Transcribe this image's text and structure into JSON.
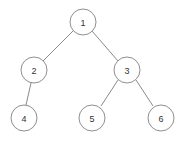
{
  "diagram": {
    "kind": "binary-tree",
    "background_color": "#ffffff",
    "node_fill_color": "#ffffff",
    "node_stroke_color": "#8f8f8f",
    "edge_color": "#8a8a8a",
    "label_color": "#333333",
    "node_radius": 13,
    "nodes": [
      {
        "id": "n1",
        "label": "1",
        "cx": 83,
        "cy": 22,
        "role": "root"
      },
      {
        "id": "n2",
        "label": "2",
        "cx": 34,
        "cy": 70,
        "role": "left-child-of-1"
      },
      {
        "id": "n3",
        "label": "3",
        "cx": 127,
        "cy": 70,
        "role": "right-child-of-1"
      },
      {
        "id": "n4",
        "label": "4",
        "cx": 24,
        "cy": 118,
        "role": "left-child-of-2"
      },
      {
        "id": "n5",
        "label": "5",
        "cx": 92,
        "cy": 118,
        "role": "left-child-of-3"
      },
      {
        "id": "n6",
        "label": "6",
        "cx": 161,
        "cy": 118,
        "role": "right-child-of-3"
      }
    ],
    "edges": [
      {
        "id": "e1",
        "from": "n1",
        "to": "n2",
        "x1": 73,
        "y1": 31,
        "x2": 43,
        "y2": 61
      },
      {
        "id": "e2",
        "from": "n1",
        "to": "n3",
        "x1": 92,
        "y1": 31,
        "x2": 118,
        "y2": 61
      },
      {
        "id": "e3",
        "from": "n2",
        "to": "n4",
        "x1": 31,
        "y1": 83,
        "x2": 26,
        "y2": 105
      },
      {
        "id": "e4",
        "from": "n3",
        "to": "n5",
        "x1": 118,
        "y1": 80,
        "x2": 101,
        "y2": 106
      },
      {
        "id": "e5",
        "from": "n3",
        "to": "n6",
        "x1": 136,
        "y1": 80,
        "x2": 153,
        "y2": 106
      }
    ]
  }
}
